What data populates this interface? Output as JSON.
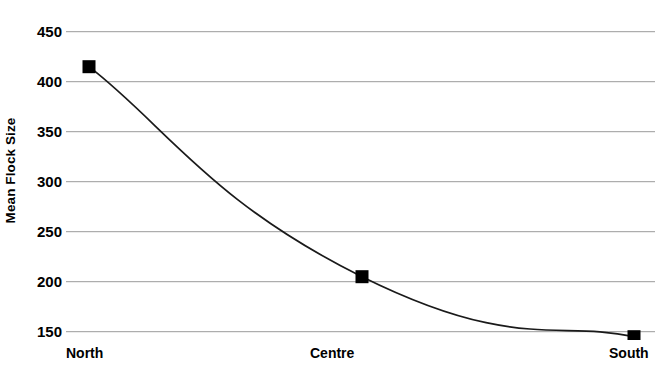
{
  "chart_data": {
    "type": "line",
    "title": "",
    "subtitle": "",
    "xlabel": "",
    "ylabel": "Mean Flock Size",
    "categories": [
      "North",
      "Centre",
      "South"
    ],
    "series": [
      {
        "name": "Mean Flock Size",
        "values": [
          415,
          205,
          145
        ],
        "marker": "filled-square",
        "marker_color": "#000000",
        "line_color": "#1a1a1a",
        "line_style": "smooth"
      }
    ],
    "x": [
      "North",
      "Centre",
      "South"
    ],
    "values": [
      415,
      205,
      145
    ],
    "ylim": [
      145,
      450
    ],
    "ytick_labels": [
      "450",
      "400",
      "350",
      "300",
      "250",
      "200",
      "150"
    ],
    "ytick_values": [
      450,
      400,
      350,
      300,
      250,
      200,
      150
    ],
    "xtick_labels": [
      "North",
      "Centre",
      "South"
    ],
    "grid": {
      "horizontal": true,
      "vertical": false,
      "color": "#9a9a9a"
    },
    "legend": {
      "visible": false,
      "position": "none",
      "entries": []
    },
    "annotations": [],
    "colors": {
      "background": "#ffffff",
      "axis_text": "#000000",
      "grid": "#9a9a9a",
      "data_line": "#1a1a1a",
      "marker": "#000000"
    }
  }
}
